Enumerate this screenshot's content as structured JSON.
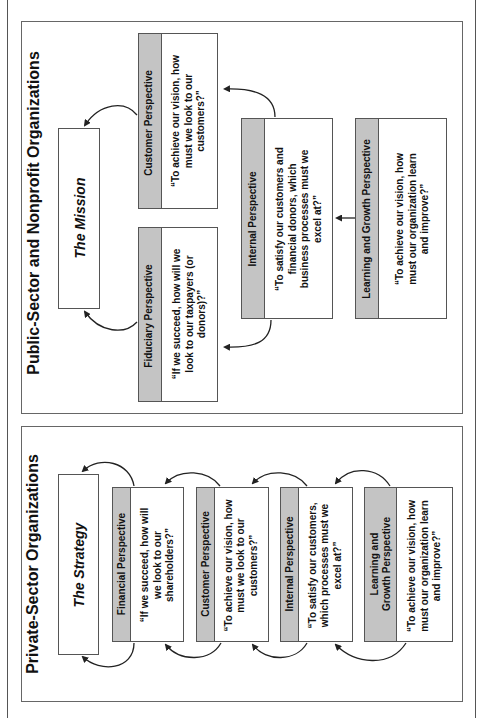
{
  "colors": {
    "header_fill": "#c4c4c4",
    "border": "#555555",
    "background": "#ffffff"
  },
  "public": {
    "title": "Public-Sector and Nonprofit Organizations",
    "goal": "The Mission",
    "perspectives": [
      {
        "id": "customer",
        "header": "Customer Perspective",
        "question": "“To achieve our vision, how must we look to our customers?”"
      },
      {
        "id": "fiduciary",
        "header": "Fiduciary Perspective",
        "question": "“If we succeed, how will we look to our taxpayers (or donors)?”"
      },
      {
        "id": "internal",
        "header": "Internal Perspective",
        "question": "“To satisfy our customers and financial donors, which business processes must we excel at?”"
      },
      {
        "id": "learning",
        "header": "Learning and Growth Perspective",
        "question": "“To achieve our vision, how must our organization learn and improve?”"
      }
    ]
  },
  "private": {
    "title": "Private-Sector Organizations",
    "goal": "The Strategy",
    "perspectives": [
      {
        "id": "financial",
        "header": "Financial Perspective",
        "question": "“If we succeed, how will we look to our shareholders?”"
      },
      {
        "id": "customer",
        "header": "Customer Perspective",
        "question": "“To achieve our vision, how must we look to our customers?”"
      },
      {
        "id": "internal",
        "header": "Internal Perspective",
        "question": "“To satisfy our customers, which processes must we excel at?”"
      },
      {
        "id": "learning",
        "header": "Learning and Growth Perspective",
        "question": "“To achieve our vision, how must our organization learn and improve?”"
      }
    ]
  }
}
